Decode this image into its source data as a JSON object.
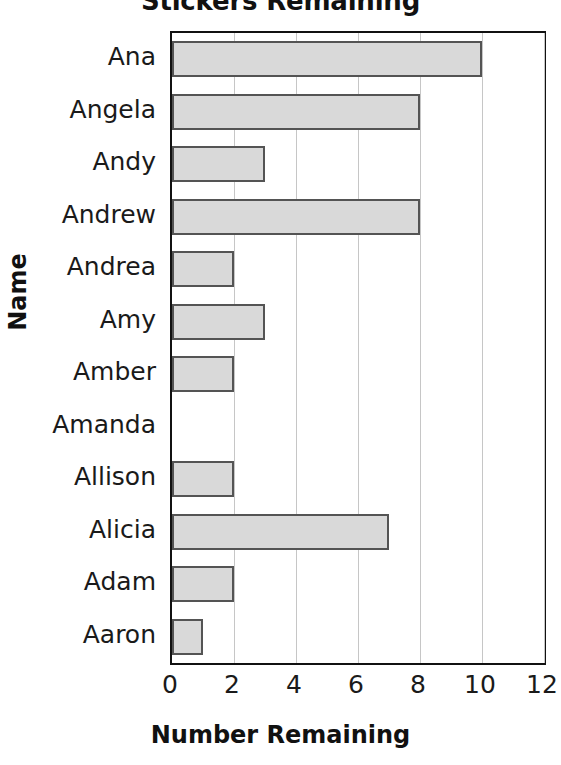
{
  "chart_data": {
    "type": "bar",
    "orientation": "horizontal",
    "title": "Stickers Remaining",
    "xlabel": "Number Remaining",
    "ylabel": "Name",
    "categories": [
      "Ana",
      "Angela",
      "Andy",
      "Andrew",
      "Andrea",
      "Amy",
      "Amber",
      "Amanda",
      "Allison",
      "Alicia",
      "Adam",
      "Aaron"
    ],
    "values": [
      10,
      8,
      3,
      8,
      2,
      3,
      2,
      0,
      2,
      7,
      2,
      1
    ],
    "xlim": [
      0,
      12
    ],
    "xticks": [
      0,
      2,
      4,
      6,
      8,
      10,
      12
    ],
    "xtick_labels": [
      "0",
      "2",
      "4",
      "6",
      "8",
      "10",
      "12"
    ],
    "grid": "vertical",
    "legend": "none",
    "colors": {
      "bar_fill": "#d9d9d9",
      "bar_border": "#545454",
      "gridline": "#c6c6c6",
      "axis": "#111111",
      "text": "#1a1a1a"
    }
  }
}
